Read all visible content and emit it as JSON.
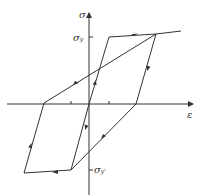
{
  "diagram": {
    "axes": {
      "y_label": "σ",
      "x_label": "ε"
    },
    "levels": {
      "yield_tension": {
        "symbol": "σ",
        "subscript": "y"
      },
      "yield_compression": {
        "symbol": "σ",
        "subscript": "y",
        "prime": "'"
      }
    },
    "colors": {
      "line": "#333333",
      "background": "#ffffff"
    }
  }
}
